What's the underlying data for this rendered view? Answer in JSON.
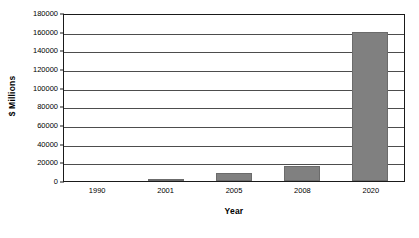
{
  "chart_data": {
    "type": "bar",
    "title": "",
    "subtitle": "",
    "xlabel": "Year",
    "ylabel": "$ Millions",
    "categories": [
      "1990",
      "2001",
      "2005",
      "2008",
      "2020"
    ],
    "values": [
      0,
      2000,
      9000,
      16000,
      160000
    ],
    "series": [
      {
        "name": "",
        "values": [
          0,
          2000,
          9000,
          16000,
          160000
        ]
      }
    ],
    "ylim": [
      0,
      180000
    ],
    "ytick_labels": [
      "180000",
      "160000",
      "140000",
      "120000",
      "100000",
      "80000",
      "60000",
      "40000",
      "20000",
      "0"
    ],
    "ytick_values": [
      180000,
      160000,
      140000,
      120000,
      100000,
      80000,
      60000,
      40000,
      20000,
      0
    ],
    "ytick_step": 20000,
    "grid": true,
    "grid_axis": "y",
    "legend": false,
    "legend_position": "none",
    "bar_color": "#808080",
    "axis_color": "#1a1a1a",
    "gridline_color": "#4d4d4d",
    "background_color": "#ffffff",
    "annotations": []
  }
}
